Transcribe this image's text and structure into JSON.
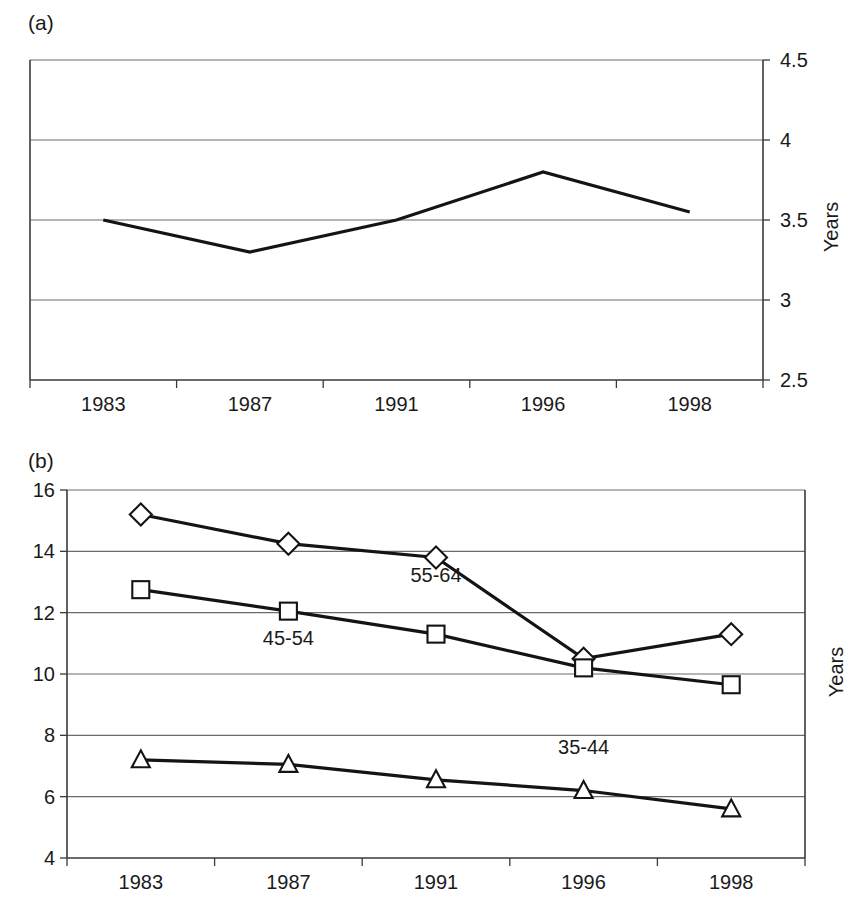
{
  "figure": {
    "panel_a_label": "(a)",
    "panel_b_label": "(b)",
    "y_axis_title_a": "Years",
    "y_axis_title_b": "Years"
  },
  "chart_data": [
    {
      "type": "line",
      "panel": "(a)",
      "title": "",
      "xlabel": "",
      "ylabel": "Years",
      "categories": [
        "1983",
        "1987",
        "1991",
        "1996",
        "1998"
      ],
      "ylim": [
        2.5,
        4.5
      ],
      "yticks": [
        "2.5",
        "3",
        "3.5",
        "4",
        "4.5"
      ],
      "ytick_values": [
        2.5,
        3,
        3.5,
        4,
        4.5
      ],
      "grid": true,
      "y_axis_position": "right",
      "legend": "none",
      "series": [
        {
          "name": "",
          "marker": "none",
          "values": [
            3.5,
            3.3,
            3.5,
            3.8,
            3.55
          ]
        }
      ]
    },
    {
      "type": "line",
      "panel": "(b)",
      "title": "",
      "xlabel": "",
      "ylabel": "Years",
      "categories": [
        "1983",
        "1987",
        "1991",
        "1996",
        "1998"
      ],
      "ylim": [
        4,
        16
      ],
      "yticks": [
        "4",
        "6",
        "8",
        "10",
        "12",
        "14",
        "16"
      ],
      "ytick_values": [
        4,
        6,
        8,
        10,
        12,
        14,
        16
      ],
      "grid": true,
      "y_axis_position": "left",
      "legend": "inline-annotations",
      "series": [
        {
          "name": "55-64",
          "marker": "diamond",
          "values": [
            15.2,
            14.25,
            13.8,
            10.5,
            11.3
          ],
          "label_x_category": "1991",
          "label_value": 13.0
        },
        {
          "name": "45-54",
          "marker": "square",
          "values": [
            12.75,
            12.05,
            11.3,
            10.2,
            9.65
          ],
          "label_x_category": "1987",
          "label_value": 10.95
        },
        {
          "name": "35-44",
          "marker": "triangle",
          "values": [
            7.2,
            7.05,
            6.55,
            6.2,
            5.6
          ],
          "label_x_category": "1996",
          "label_value": 7.4
        }
      ]
    }
  ],
  "colors": {
    "line": "#141414",
    "grid": "#6b6b6b",
    "axis": "#3a3a3a",
    "marker_fill": "#ffffff",
    "background": "#ffffff"
  }
}
